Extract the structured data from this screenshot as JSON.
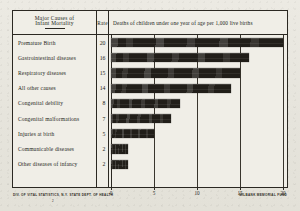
{
  "chart_data": {
    "type": "bar",
    "orientation": "horizontal",
    "title": "Major Causes of Infant Mortality",
    "xlabel": "Deaths of children under one year of age per 1,000 live births",
    "ylabel": "Major Causes of Infant Mortality",
    "categories": [
      "Premature Birth",
      "Gastrointestinal diseases",
      "Respiratory diseases",
      "All other causes",
      "Congenital debility",
      "Congenital malformations",
      "Injuries at birth",
      "Communicable diseases",
      "Other diseases of infancy"
    ],
    "values": [
      20,
      16,
      15,
      14,
      8,
      7,
      5,
      2,
      2
    ],
    "xlim": [
      0,
      20
    ],
    "xticks": [
      0,
      5,
      10,
      15,
      20
    ],
    "xtick_labels": [
      "0",
      "5",
      "10",
      "15",
      "20"
    ],
    "grid": true,
    "legend": "none",
    "bar_color": "#211e19"
  },
  "header": {
    "cause_line1": "Major Causes of",
    "cause_line2": "Infant Mortality",
    "rate": "Rate",
    "deaths": "Deaths of children under one year of age per 1,000 live births"
  },
  "rows": [
    {
      "label": "Premature Birth",
      "rate": "20",
      "value": 20
    },
    {
      "label": "Gastrointestinal diseases",
      "rate": "16",
      "value": 16
    },
    {
      "label": "Respiratory diseases",
      "rate": "15",
      "value": 15
    },
    {
      "label": "All other causes",
      "rate": "14",
      "value": 14
    },
    {
      "label": "Congenital debility",
      "rate": "8",
      "value": 8
    },
    {
      "label": "Congenital malformations",
      "rate": "7",
      "value": 7
    },
    {
      "label": "Injuries at birth",
      "rate": "5",
      "value": 5
    },
    {
      "label": "Communicable diseases",
      "rate": "2",
      "value": 2
    },
    {
      "label": "Other diseases of infancy",
      "rate": "2",
      "value": 2
    }
  ],
  "axis": {
    "ticks": [
      "0",
      "5",
      "10",
      "15",
      "20"
    ]
  },
  "footer": {
    "left": "DIV. OF VITAL STATISTICS, N.Y. STATE DEPT. OF HEALTH",
    "right": "MILBANK MEMORIAL FUND",
    "mark": "2"
  }
}
